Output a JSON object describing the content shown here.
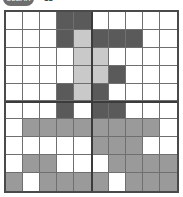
{
  "header": {
    "pill_label": "CLEAR",
    "count_label": "18"
  },
  "palette": {
    "empty": "#ffffff",
    "light": "#c9c9c9",
    "medium": "#9a9a9a",
    "dark": "#5a5a5a",
    "grid_line": "#6f6f6f",
    "border": "#4a4a4a",
    "block_divider": "#3b3b3b"
  },
  "board": {
    "columns": 10,
    "rows": 10,
    "block_size": 5,
    "legend": {
      "0": "empty",
      "1": "light",
      "2": "medium",
      "3": "dark"
    },
    "grid": [
      [
        0,
        0,
        0,
        3,
        3,
        0,
        0,
        0,
        0,
        0
      ],
      [
        0,
        0,
        0,
        3,
        1,
        3,
        3,
        3,
        0,
        0
      ],
      [
        0,
        0,
        0,
        0,
        1,
        1,
        0,
        0,
        0,
        0
      ],
      [
        0,
        0,
        0,
        0,
        1,
        1,
        3,
        0,
        0,
        0
      ],
      [
        0,
        0,
        0,
        3,
        1,
        3,
        0,
        0,
        0,
        0
      ],
      [
        0,
        0,
        0,
        3,
        0,
        3,
        3,
        0,
        0,
        0
      ],
      [
        0,
        2,
        2,
        2,
        2,
        2,
        2,
        2,
        2,
        0
      ],
      [
        0,
        0,
        0,
        0,
        0,
        2,
        2,
        2,
        0,
        0
      ],
      [
        0,
        2,
        2,
        0,
        0,
        0,
        2,
        2,
        2,
        2
      ],
      [
        2,
        0,
        2,
        2,
        2,
        2,
        0,
        2,
        2,
        2
      ]
    ]
  }
}
